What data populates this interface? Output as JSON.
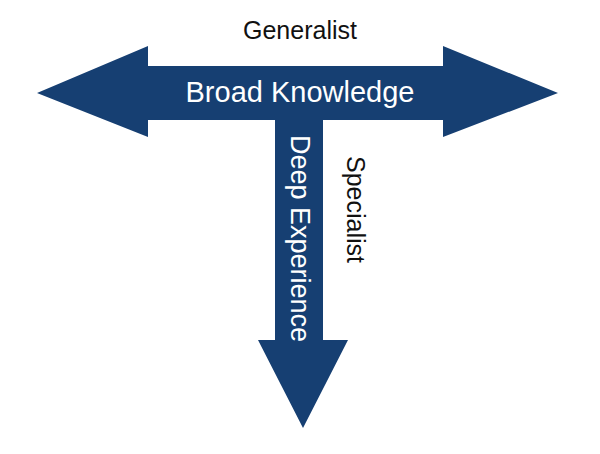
{
  "diagram": {
    "type": "T-shaped skills diagram",
    "colors": {
      "arrow_fill": "#163f72",
      "arrow_text": "#ffffff",
      "label_text": "#111111",
      "background": "#ffffff"
    },
    "horizontal_arrow": {
      "label_inside": "Broad Knowledge",
      "label_above": "Generalist",
      "direction": "bidirectional-horizontal"
    },
    "vertical_arrow": {
      "label_inside": "Deep Experience",
      "label_beside": "Specialist",
      "direction": "down"
    }
  }
}
